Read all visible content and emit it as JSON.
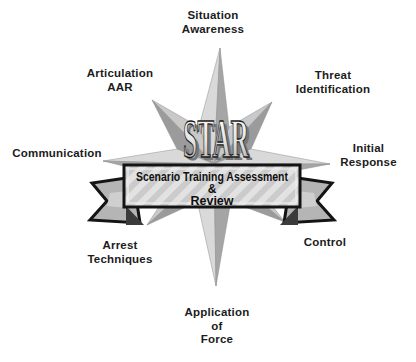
{
  "diagram": {
    "acronym": "STAR",
    "banner_lines": [
      "Scenario Training Assessment",
      "&",
      "Review"
    ]
  },
  "labels": [
    {
      "id": "situation-awareness",
      "lines": [
        "Situation",
        "Awareness"
      ]
    },
    {
      "id": "articulation-aar",
      "lines": [
        "Articulation",
        "AAR"
      ]
    },
    {
      "id": "threat-identification",
      "lines": [
        "Threat",
        "Identification"
      ]
    },
    {
      "id": "communication",
      "lines": [
        "Communication"
      ]
    },
    {
      "id": "initial-response",
      "lines": [
        "Initial",
        "Response"
      ]
    },
    {
      "id": "arrest-techniques",
      "lines": [
        "Arrest",
        "Techniques"
      ]
    },
    {
      "id": "control",
      "lines": [
        "Control"
      ]
    },
    {
      "id": "application-of-force",
      "lines": [
        "Application",
        "of",
        "Force"
      ]
    }
  ],
  "colors": {
    "background": "#ffffff",
    "star_point_light": "#d9d9d9",
    "star_point_dark": "#a5a5a5",
    "star_diagonal_light": "#c9c9c9",
    "star_diagonal_dark": "#9b9b9b",
    "ribbon_fill": "#b5b5b5",
    "ribbon_fold_dark": "#3b3b3b",
    "outline_black": "#141414",
    "banner_stripe_a": "#cbcbcb",
    "banner_stripe_b": "#e2e2e2",
    "label_text": "#1c1c1c",
    "star_text_shadow": "#777777"
  }
}
